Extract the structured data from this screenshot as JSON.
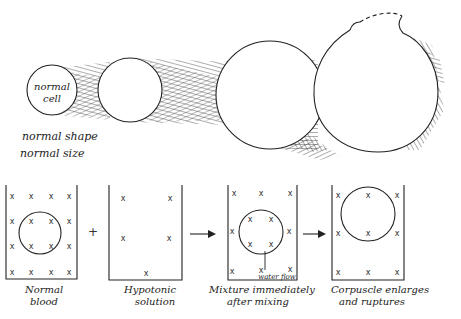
{
  "diagram": {
    "type": "hemolysis-illustration",
    "top_row": {
      "cell_label_line1": "normal",
      "cell_label_line2": "cell",
      "caption_line1": "normal shape",
      "caption_line2": "normal size",
      "stages": [
        {
          "name": "normal cell",
          "radius": 25
        },
        {
          "name": "swelling cell 1",
          "radius": 33
        },
        {
          "name": "swelling cell 2",
          "radius": 54
        },
        {
          "name": "ruptured cell",
          "radius": 62
        }
      ]
    },
    "bottom_row": {
      "beakers": [
        {
          "label_line1": "Normal",
          "label_line2": "blood"
        },
        {
          "label_line1": "Hypotonic",
          "label_line2": "solution"
        },
        {
          "label_line1": "Mixture immediately",
          "label_line2": "after mixing",
          "annotation": "water flow"
        },
        {
          "label_line1": "Corpuscle enlarges",
          "label_line2": "and ruptures"
        }
      ],
      "plus_symbol": "+",
      "solute_marker": "x"
    },
    "colors": {
      "ink": "#222222",
      "background": "#ffffff"
    }
  }
}
